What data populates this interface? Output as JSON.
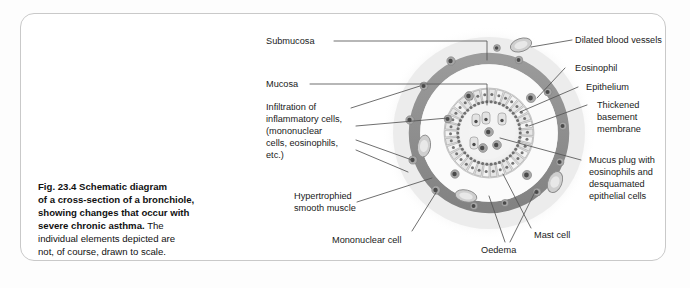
{
  "figure": {
    "number": "Fig. 23.4",
    "caption_bold": "Schematic diagram of a cross-section of a bronchiole, showing changes that occur with severe chronic asthma.",
    "caption_line1_bold": "Schematic diagram",
    "caption_line2_bold": "of a cross-section of a bronchiole,",
    "caption_line3_bold": "showing changes that occur with",
    "caption_line4_bold": "severe chronic asthma.",
    "caption_line4_rest": " The",
    "caption_line5": "individual elements depicted are",
    "caption_line6": "not, of course, drawn to scale."
  },
  "labels": {
    "submucosa": "Submucosa",
    "mucosa": "Mucosa",
    "infiltration_l1": "Infiltration of",
    "infiltration_l2": "inflammatory cells,",
    "infiltration_l3": "(mononuclear",
    "infiltration_l4": "cells, eosinophils,",
    "infiltration_l5": "etc.)",
    "hypertrophied_l1": "Hypertrophied",
    "hypertrophied_l2": "smooth muscle",
    "mononuclear_cell": "Mononuclear cell",
    "oedema": "Oedema",
    "mast_cell": "Mast cell",
    "dilated_blood_vessels": "Dilated blood vessels",
    "eosinophil": "Eosinophil",
    "epithelium": "Epithelium",
    "thickened_l1": "Thickened",
    "thickened_l2": "basement",
    "thickened_l3": "membrane",
    "mucus_plug_l1": "Mucus plug with",
    "mucus_plug_l2": "eosinophils and",
    "mucus_plug_l3": "desquamated",
    "mucus_plug_l4": "epithelial cells"
  },
  "colors": {
    "page_background": "#fdfdfd",
    "card_background": "#ffffff",
    "card_border": "#c9c9c9",
    "text": "#1a1a1a",
    "leader_line": "#555555",
    "submucosa_halo": "#f1f1f1",
    "submucosa_fill": "#ededed",
    "smooth_muscle_ring": "#909090",
    "mucosa_fill": "#fbfbfb",
    "epithelium_fill": "#dcdcdc",
    "basement_membrane": "#6f6f6f",
    "lumen_fill": "#f7f7f7",
    "mucus_plug": "#e9e9e9",
    "cell_fill": "#a8a8a8",
    "cell_nucleus": "#4a4a4a",
    "vessel_fill": "#cfcfcf",
    "vessel_stroke": "#8a8a8a"
  },
  "diagram": {
    "type": "anatomical-cross-section",
    "center": {
      "x": 489,
      "y": 133
    },
    "rings": [
      {
        "name": "submucosa-halo",
        "radius": 106
      },
      {
        "name": "submucosa",
        "radius": 96
      },
      {
        "name": "smooth-muscle-outer",
        "radius": 80
      },
      {
        "name": "smooth-muscle-inner",
        "radius": 69
      },
      {
        "name": "mucosa",
        "radius": 69
      },
      {
        "name": "epithelium-outer",
        "radius": 45
      },
      {
        "name": "basement-membrane",
        "radius": 43
      },
      {
        "name": "lumen",
        "radius": 29
      }
    ],
    "inflammatory_cells": [
      {
        "x": 451,
        "y": 61,
        "r": 4.2
      },
      {
        "x": 519,
        "y": 60,
        "r": 3.8
      },
      {
        "x": 424,
        "y": 86,
        "r": 4.0
      },
      {
        "x": 548,
        "y": 92,
        "r": 4.0
      },
      {
        "x": 410,
        "y": 120,
        "r": 4.2
      },
      {
        "x": 563,
        "y": 126,
        "r": 3.9
      },
      {
        "x": 413,
        "y": 160,
        "r": 4.1
      },
      {
        "x": 560,
        "y": 162,
        "r": 4.0
      },
      {
        "x": 436,
        "y": 190,
        "r": 4.2
      },
      {
        "x": 537,
        "y": 192,
        "r": 4.0
      },
      {
        "x": 474,
        "y": 206,
        "r": 3.8
      },
      {
        "x": 505,
        "y": 203,
        "r": 3.6
      },
      {
        "x": 469,
        "y": 96,
        "r": 4.4
      },
      {
        "x": 531,
        "y": 98,
        "r": 4.6
      },
      {
        "x": 455,
        "y": 174,
        "r": 4.2
      },
      {
        "x": 527,
        "y": 175,
        "r": 4.6
      },
      {
        "x": 448,
        "y": 119,
        "r": 3.9
      },
      {
        "x": 497,
        "y": 48,
        "r": 3.4
      }
    ],
    "blood_vessels": [
      {
        "cx": 521,
        "cy": 45,
        "rx": 11,
        "ry": 6.5,
        "rot": -18
      },
      {
        "cx": 424,
        "cy": 146,
        "rx": 6.5,
        "ry": 11,
        "rot": 8
      },
      {
        "cx": 555,
        "cy": 182,
        "rx": 7,
        "ry": 11,
        "rot": 22
      },
      {
        "cx": 466,
        "cy": 196,
        "rx": 11,
        "ry": 6,
        "rot": 12
      }
    ],
    "epithelium_cell_count": 34,
    "lumen_contents": [
      {
        "x": 476,
        "y": 120,
        "type": "desquamated-epithelial"
      },
      {
        "x": 486,
        "y": 118,
        "type": "desquamated-epithelial"
      },
      {
        "x": 502,
        "y": 119,
        "type": "desquamated-epithelial"
      },
      {
        "x": 489,
        "y": 132,
        "type": "eosinophil"
      },
      {
        "x": 474,
        "y": 143,
        "type": "desquamated-epithelial"
      },
      {
        "x": 497,
        "y": 145,
        "type": "eosinophil"
      },
      {
        "x": 483,
        "y": 148,
        "type": "eosinophil"
      }
    ]
  }
}
